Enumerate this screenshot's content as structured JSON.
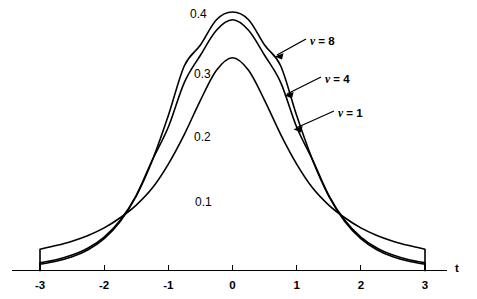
{
  "figure": {
    "axis_title_x": "t",
    "background": "#ffffff",
    "ink_color": "#000000"
  },
  "axis": {
    "ticks": [
      {
        "value": -3,
        "label": "-3"
      },
      {
        "value": -2,
        "label": "-2"
      },
      {
        "value": -1,
        "label": "-1"
      },
      {
        "value": 0,
        "label": "0"
      },
      {
        "value": 1,
        "label": "1"
      },
      {
        "value": 2,
        "label": "2"
      },
      {
        "value": 3,
        "label": "3"
      }
    ]
  },
  "density_labels": [
    {
      "text": "0.4",
      "x": 190,
      "y": 8
    },
    {
      "text": "0.3",
      "x": 194,
      "y": 68
    },
    {
      "text": "0.2",
      "x": 194,
      "y": 131
    },
    {
      "text": "0.1",
      "x": 195,
      "y": 196
    }
  ],
  "series_labels": [
    {
      "nu": "ν",
      "text": " = 8",
      "full": "ν = 8",
      "x": 310,
      "y": 36
    },
    {
      "nu": "ν",
      "text": " = 4",
      "full": "ν = 4",
      "x": 325,
      "y": 74
    },
    {
      "nu": "ν",
      "text": " = 1",
      "full": "ν = 1",
      "x": 338,
      "y": 108
    }
  ],
  "chart_data": {
    "type": "line",
    "title": "",
    "subtitle": "",
    "xlabel": "t",
    "ylabel": "",
    "xlim": [
      -3,
      3
    ],
    "ylim": [
      0,
      0.42
    ],
    "grid": false,
    "legend_position": "inline-annotations",
    "xticks": [
      -3,
      -2,
      -1,
      0,
      1,
      2,
      3
    ],
    "xticklabels": [
      "-3",
      "-2",
      "-1",
      "0",
      "1",
      "2",
      "3"
    ],
    "yticks": [
      0.1,
      0.2,
      0.3,
      0.4
    ],
    "yticklabels": [
      "0.1",
      "0.2",
      "0.3",
      "0.4"
    ],
    "annotations": [
      "ν = 8",
      "ν = 4",
      "ν = 1"
    ],
    "x": [
      -3,
      -2.75,
      -2.5,
      -2.25,
      -2,
      -1.75,
      -1.5,
      -1.25,
      -1,
      -0.75,
      -0.5,
      -0.25,
      0,
      0.25,
      0.5,
      0.75,
      1,
      1.25,
      1.5,
      1.75,
      2,
      2.25,
      2.5,
      2.75,
      3
    ],
    "series": [
      {
        "name": "ν = 8",
        "nu": 8,
        "peak": 0.3867,
        "values": [
          0.0093,
          0.0137,
          0.0205,
          0.0311,
          0.0477,
          0.0733,
          0.1114,
          0.1646,
          0.2317,
          0.3063,
          0.3374,
          0.3752,
          0.3867,
          0.3752,
          0.3374,
          0.3063,
          0.2317,
          0.1646,
          0.1114,
          0.0733,
          0.0477,
          0.0311,
          0.0205,
          0.0137,
          0.0093
        ]
      },
      {
        "name": "ν = 4",
        "nu": 4,
        "peak": 0.375,
        "values": [
          0.0114,
          0.0161,
          0.0231,
          0.0336,
          0.0499,
          0.075,
          0.1125,
          0.1651,
          0.2147,
          0.2815,
          0.322,
          0.3594,
          0.375,
          0.3594,
          0.322,
          0.2815,
          0.2147,
          0.1651,
          0.1125,
          0.075,
          0.0499,
          0.0336,
          0.0231,
          0.0161,
          0.0114
        ]
      },
      {
        "name": "ν = 1",
        "nu": 1,
        "peak": 0.3183,
        "values": [
          0.0318,
          0.0373,
          0.0439,
          0.0524,
          0.0637,
          0.0789,
          0.0979,
          0.1233,
          0.1592,
          0.2037,
          0.2546,
          0.2995,
          0.3183,
          0.2995,
          0.2546,
          0.2037,
          0.1592,
          0.1233,
          0.0979,
          0.0789,
          0.0637,
          0.0524,
          0.0439,
          0.0373,
          0.0318
        ]
      }
    ]
  }
}
